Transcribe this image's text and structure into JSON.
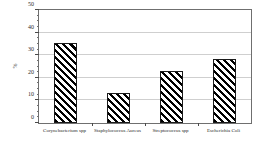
{
  "chart_data": {
    "type": "bar",
    "title": "",
    "xlabel": "",
    "ylabel": "%",
    "categories": [
      "Corynebacterium spp",
      "Staphylococcus Aureus",
      "Streptococcus spp",
      "Escherichia Coli"
    ],
    "values": [
      35.5,
      13.3,
      23.0,
      28.5
    ],
    "ylim": [
      0,
      50
    ],
    "ytick_labels": [
      "0",
      "10",
      "20",
      "30",
      "40",
      "50"
    ],
    "ytick_values": [
      0,
      10,
      20,
      30,
      40,
      50
    ],
    "minor_tick_step": 2.5,
    "grid": true,
    "legend": "none",
    "bar_fill": "diagonal-hatch",
    "bar_edge_color": "#1a1a1a",
    "grid_color": "#cfcfcf",
    "frame_color": "#6f6f6f"
  }
}
